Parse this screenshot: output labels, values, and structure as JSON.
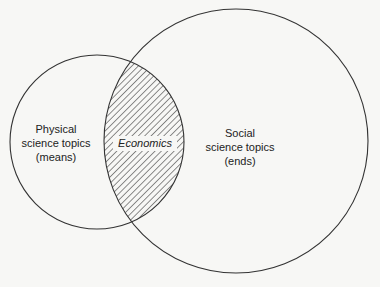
{
  "diagram": {
    "type": "venn",
    "sets": [
      {
        "id": "physical",
        "label_lines": [
          "Physical",
          "science topics",
          "(means)"
        ],
        "circle": {
          "cx": 97,
          "cy": 142,
          "r": 87
        }
      },
      {
        "id": "social",
        "label_lines": [
          "Social",
          "science topics",
          "(ends)"
        ],
        "circle": {
          "cx": 236,
          "cy": 141,
          "r": 132
        }
      }
    ],
    "intersection": {
      "label": "Economics",
      "fill": "diagonal-hatch"
    },
    "colors": {
      "background": "#f7f7f5",
      "stroke": "#333333",
      "text": "#222222",
      "hatch": "#333333"
    }
  }
}
